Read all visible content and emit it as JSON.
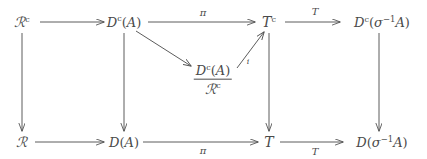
{
  "diagram": {
    "type": "commutative-diagram",
    "background_color": "#ffffff",
    "ink_color": "#4a4a4a",
    "width": 427,
    "height": 159,
    "nodes": {
      "top_left": "R^c",
      "top_second": "D^c(A)",
      "top_third": "T^c",
      "top_right": "D^c(sigma^-1 A)",
      "center_quotient_numerator": "D^c(A)",
      "center_quotient_denominator": "R^c",
      "bottom_left": "R",
      "bottom_second": "D(A)",
      "bottom_third": "T",
      "bottom_right": "D(sigma^-1 A)"
    },
    "arrow_labels": {
      "top_pi": "π",
      "top_T": "T",
      "bottom_pi": "π",
      "bottom_T": "T",
      "diagonal_i": "i"
    },
    "glyphs": {
      "script_R": "ℛ",
      "script_T": "T",
      "D": "D",
      "A": "A",
      "sigma": "σ",
      "superscript_c": "c",
      "exponent_minus_one": "−1",
      "left_paren": "(",
      "right_paren": ")"
    },
    "arrows": [
      {
        "name": "R^c-to-D^c(A)",
        "from": "top_left",
        "to": "top_second",
        "direction": "right"
      },
      {
        "name": "D^c(A)-to-T^c",
        "from": "top_second",
        "to": "top_third",
        "direction": "right",
        "label": "π"
      },
      {
        "name": "T^c-to-D^c(sigma^-1A)",
        "from": "top_third",
        "to": "top_right",
        "direction": "right",
        "label": "T"
      },
      {
        "name": "R-to-D(A)",
        "from": "bottom_left",
        "to": "bottom_second",
        "direction": "right"
      },
      {
        "name": "D(A)-to-T",
        "from": "bottom_second",
        "to": "bottom_third",
        "direction": "right",
        "label": "π"
      },
      {
        "name": "T-to-D(sigma^-1A)",
        "from": "bottom_third",
        "to": "bottom_right",
        "direction": "right",
        "label": "T"
      },
      {
        "name": "R^c-to-R",
        "from": "top_left",
        "to": "bottom_left",
        "direction": "down"
      },
      {
        "name": "D^c(A)-to-D(A)",
        "from": "top_second",
        "to": "bottom_second",
        "direction": "down"
      },
      {
        "name": "T^c-to-T",
        "from": "top_third",
        "to": "bottom_third",
        "direction": "down"
      },
      {
        "name": "D^c(sigma^-1A)-to-D(sigma^-1A)",
        "from": "top_right",
        "to": "bottom_right",
        "direction": "down"
      },
      {
        "name": "D^c(A)-to-quotient",
        "from": "top_second",
        "to": "center_quotient",
        "direction": "diagonal-down-right"
      },
      {
        "name": "quotient-to-T^c",
        "from": "center_quotient",
        "to": "top_third",
        "direction": "diagonal-up-right",
        "label": "i"
      }
    ]
  }
}
